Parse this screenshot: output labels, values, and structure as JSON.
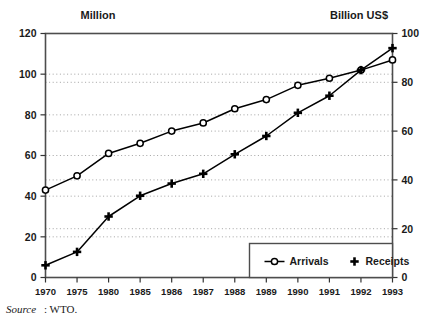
{
  "figure": {
    "left_axis_header": "Million",
    "right_axis_header": "Billion US$",
    "source_prefix": "Source",
    "source_text": ": WTO."
  },
  "legend": {
    "arrivals_label": "Arrivals",
    "receipts_label": "Receipts"
  },
  "chart_data": {
    "type": "line",
    "title": "",
    "xlabel": "",
    "ylabel": "Million",
    "y2label": "Billion US$",
    "categories": [
      "1970",
      "1975",
      "1980",
      "1985",
      "1986",
      "1987",
      "1988",
      "1989",
      "1990",
      "1991",
      "1992",
      "1993"
    ],
    "series": [
      {
        "name": "Arrivals",
        "axis": "left",
        "unit": "Million",
        "marker": "open-circle",
        "values": [
          43,
          50,
          61,
          66,
          72,
          76,
          83,
          87.5,
          94.5,
          98,
          102,
          107
        ]
      },
      {
        "name": "Receipts",
        "axis": "right",
        "unit": "Billion US$",
        "marker": "plus",
        "values": [
          5,
          10.5,
          25,
          33.5,
          38.5,
          42.5,
          50.5,
          58,
          67.5,
          74.5,
          85,
          94
        ]
      }
    ],
    "ylim": [
      0,
      120
    ],
    "yticks": [
      0,
      20,
      40,
      60,
      80,
      100,
      120
    ],
    "y2lim": [
      0,
      100
    ],
    "y2ticks": [
      0,
      20,
      40,
      60,
      80,
      100
    ],
    "grid": true,
    "legend_position": "bottom-right"
  }
}
